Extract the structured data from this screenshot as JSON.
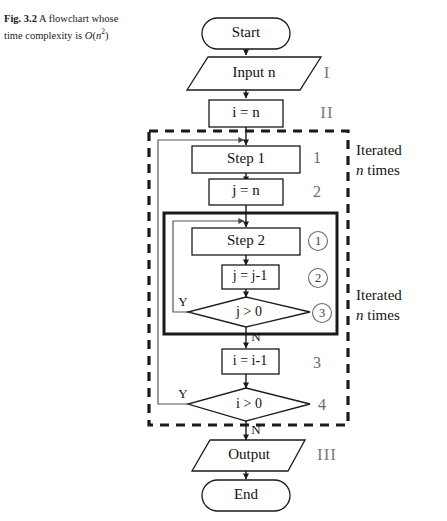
{
  "figure": {
    "label": "Fig. 3.2",
    "caption_part1": "A flowchart whose",
    "caption_part2": "time complexity is ",
    "complexity_o": "O",
    "complexity_open": "(",
    "complexity_var": "n",
    "complexity_exp": "2",
    "complexity_close": ")"
  },
  "nodes": {
    "start": "Start",
    "input": "Input n",
    "init_i": "i = n",
    "step1": "Step 1",
    "init_j": "j = n",
    "step2": "Step 2",
    "dec_j": "j = j-1",
    "cond_j": "j > 0",
    "dec_i": "i = i-1",
    "cond_i": "i > 0",
    "output": "Output",
    "end": "End"
  },
  "edge_labels": {
    "inner_yes": "Y",
    "inner_no": "N",
    "outer_yes": "Y",
    "outer_no": "N"
  },
  "step_numbers": {
    "step1": "1",
    "init_j": "2",
    "dec_i": "3",
    "cond_i": "4"
  },
  "circled_numbers": {
    "step2": "1",
    "dec_j": "2",
    "cond_j": "3"
  },
  "roman_numerals": {
    "input": "I",
    "init_i": "II",
    "output": "III"
  },
  "annotations": {
    "outer_loop_line1": "Iterated",
    "outer_loop_line2_var": "n",
    "outer_loop_line2_rest": " times",
    "inner_loop_line1": "Iterated",
    "inner_loop_line2_var": "n",
    "inner_loop_line2_rest": " times"
  },
  "colors": {
    "ink": "#1a1a1a",
    "muted": "#6a6a6a",
    "paper": "#ffffff"
  }
}
